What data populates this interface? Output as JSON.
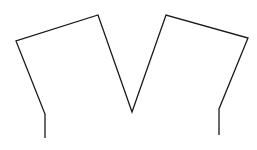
{
  "diagram": {
    "background_color": "#ffffff",
    "stroke_color": "#1a1a1a",
    "stroke_width": 1.3,
    "viewbox": [
      0,
      0,
      257,
      150
    ],
    "shape": "open polyline (M / crown outline)",
    "points": [
      [
        45,
        138
      ],
      [
        45,
        114
      ],
      [
        16,
        41
      ],
      [
        98,
        15
      ],
      [
        132,
        112
      ],
      [
        166,
        15
      ],
      [
        248,
        38
      ],
      [
        219,
        109
      ],
      [
        219,
        135
      ]
    ]
  }
}
